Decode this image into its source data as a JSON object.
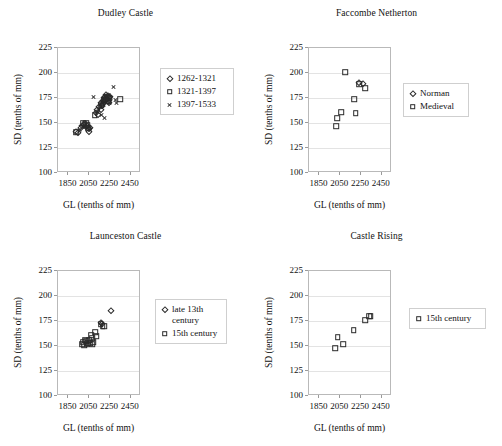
{
  "figure": {
    "width": 502,
    "height": 446,
    "background": "#ffffff",
    "marker_color": "#2a2a2a",
    "frame_color": "#b9b9b9",
    "grid_color": "#e3e3e3"
  },
  "chart_data": [
    {
      "type": "scatter",
      "title": "Dudley Castle",
      "xlabel": "GL (tenths of mm)",
      "ylabel": "SD (tenths of mm)",
      "xlim": [
        1750,
        2550
      ],
      "ylim": [
        100,
        225
      ],
      "xticks": [
        1850,
        2050,
        2250,
        2450
      ],
      "yticks": [
        100,
        125,
        150,
        175,
        200,
        225
      ],
      "grid": true,
      "legend_position": "right",
      "series": [
        {
          "name": "1262-1321",
          "marker": "diamond",
          "points": [
            [
              1925,
              141
            ],
            [
              1938,
              140
            ],
            [
              1972,
              145
            ],
            [
              1983,
              147
            ],
            [
              2003,
              148
            ],
            [
              2016,
              146
            ],
            [
              2030,
              147
            ],
            [
              2044,
              144
            ],
            [
              2048,
              141
            ],
            [
              2056,
              145
            ],
            [
              2112,
              160
            ],
            [
              2125,
              163
            ],
            [
              2134,
              158
            ],
            [
              2148,
              166
            ],
            [
              2160,
              170
            ],
            [
              2168,
              163
            ],
            [
              2172,
              167
            ],
            [
              2180,
              172
            ],
            [
              2186,
              169
            ],
            [
              2192,
              175
            ],
            [
              2198,
              171
            ],
            [
              2204,
              176
            ],
            [
              2210,
              173
            ],
            [
              2216,
              178
            ],
            [
              2222,
              174
            ],
            [
              2228,
              177
            ],
            [
              2234,
              172
            ],
            [
              2240,
              175
            ],
            [
              2246,
              170
            ],
            [
              2252,
              176
            ]
          ]
        },
        {
          "name": "1321-1397",
          "marker": "square",
          "points": [
            [
              1928,
              141
            ],
            [
              1995,
              150
            ],
            [
              2008,
              149
            ],
            [
              2020,
              150
            ],
            [
              2033,
              148
            ],
            [
              2040,
              145
            ],
            [
              2104,
              158
            ],
            [
              2166,
              168
            ],
            [
              2190,
              173
            ],
            [
              2205,
              174
            ],
            [
              2218,
              176
            ],
            [
              2232,
              172
            ],
            [
              2248,
              175
            ],
            [
              2350,
              174
            ]
          ]
        },
        {
          "name": "1397-1533",
          "marker": "cross",
          "points": [
            [
              1962,
              143
            ],
            [
              1990,
              146
            ],
            [
              2035,
              147
            ],
            [
              2052,
              144
            ],
            [
              2090,
              176
            ],
            [
              2118,
              161
            ],
            [
              2140,
              163
            ],
            [
              2155,
              166
            ],
            [
              2170,
              158
            ],
            [
              2178,
              170
            ],
            [
              2188,
              168
            ],
            [
              2196,
              174
            ],
            [
              2202,
              155
            ],
            [
              2212,
              177
            ],
            [
              2224,
              173
            ],
            [
              2236,
              178
            ],
            [
              2242,
              170
            ],
            [
              2258,
              175
            ],
            [
              2286,
              186
            ],
            [
              2300,
              173
            ],
            [
              2318,
              170
            ]
          ]
        }
      ]
    },
    {
      "type": "scatter",
      "title": "Faccombe Netherton",
      "xlabel": "GL (tenths of mm)",
      "ylabel": "SD (tenths of mm)",
      "xlim": [
        1750,
        2550
      ],
      "ylim": [
        100,
        225
      ],
      "xticks": [
        1850,
        2050,
        2250,
        2450
      ],
      "yticks": [
        100,
        125,
        150,
        175,
        200,
        225
      ],
      "grid": true,
      "legend_position": "right",
      "series": [
        {
          "name": "Norman",
          "marker": "diamond",
          "points": [
            [
              2228,
              190
            ],
            [
              2268,
              189
            ]
          ]
        },
        {
          "name": "Medieval",
          "marker": "square",
          "points": [
            [
              2012,
              147
            ],
            [
              2022,
              155
            ],
            [
              2062,
              161
            ],
            [
              2098,
              201
            ],
            [
              2186,
              174
            ],
            [
              2202,
              160
            ],
            [
              2236,
              189
            ],
            [
              2290,
              185
            ]
          ]
        }
      ]
    },
    {
      "type": "scatter",
      "title": "Launceston Castle",
      "xlabel": "GL (tenths of mm)",
      "ylabel": "SD (tenths of mm)",
      "xlim": [
        1750,
        2550
      ],
      "ylim": [
        100,
        225
      ],
      "xticks": [
        1850,
        2050,
        2250,
        2450
      ],
      "yticks": [
        100,
        125,
        150,
        175,
        200,
        225
      ],
      "grid": true,
      "legend_position": "right",
      "series": [
        {
          "name": "late 13th\ncentury",
          "marker": "diamond",
          "points": [
            [
              2164,
              173
            ],
            [
              2172,
              172
            ],
            [
              2262,
              185
            ]
          ]
        },
        {
          "name": "15th century",
          "marker": "square",
          "points": [
            [
              1985,
              152
            ],
            [
              1992,
              154
            ],
            [
              2000,
              151
            ],
            [
              2012,
              156
            ],
            [
              2020,
              155
            ],
            [
              2028,
              153
            ],
            [
              2036,
              152
            ],
            [
              2050,
              156
            ],
            [
              2058,
              153
            ],
            [
              2072,
              161
            ],
            [
              2080,
              158
            ],
            [
              2086,
              152
            ],
            [
              2092,
              154
            ],
            [
              2110,
              164
            ],
            [
              2120,
              160
            ],
            [
              2160,
              172
            ],
            [
              2180,
              170
            ],
            [
              2196,
              170
            ]
          ]
        }
      ]
    },
    {
      "type": "scatter",
      "title": "Castle Rising",
      "xlabel": "GL (tenths of mm)",
      "ylabel": "SD (tenths of mm)",
      "xlim": [
        1750,
        2550
      ],
      "ylim": [
        100,
        225
      ],
      "xticks": [
        1850,
        2050,
        2250,
        2450
      ],
      "yticks": [
        100,
        125,
        150,
        175,
        200,
        225
      ],
      "grid": true,
      "legend_position": "right",
      "series": [
        {
          "name": "15th century",
          "marker": "square",
          "points": [
            [
              2000,
              148
            ],
            [
              2028,
              159
            ],
            [
              2080,
              152
            ],
            [
              2180,
              166
            ],
            [
              2290,
              176
            ],
            [
              2330,
              180
            ],
            [
              2344,
              180
            ]
          ]
        }
      ]
    }
  ]
}
